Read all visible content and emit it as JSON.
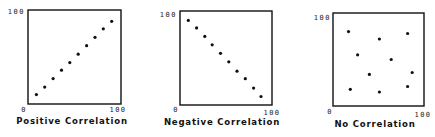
{
  "chart_data": [
    {
      "type": "scatter",
      "title": "Positive Correlation",
      "xlabel": "",
      "ylabel": "",
      "xlim": [
        0,
        100
      ],
      "ylim": [
        0,
        100
      ],
      "grid": false,
      "x_tick_labels": [
        "0",
        "100"
      ],
      "y_tick_labels": [
        "100"
      ],
      "points": [
        {
          "x": 9,
          "y": 10
        },
        {
          "x": 18,
          "y": 18
        },
        {
          "x": 27,
          "y": 27
        },
        {
          "x": 36,
          "y": 36
        },
        {
          "x": 45,
          "y": 44
        },
        {
          "x": 54,
          "y": 53
        },
        {
          "x": 63,
          "y": 62
        },
        {
          "x": 72,
          "y": 71
        },
        {
          "x": 81,
          "y": 80
        },
        {
          "x": 90,
          "y": 88
        }
      ]
    },
    {
      "type": "scatter",
      "title": "Negative Correlation",
      "xlabel": "",
      "ylabel": "",
      "xlim": [
        0,
        100
      ],
      "ylim": [
        0,
        100
      ],
      "grid": false,
      "x_tick_labels": [
        "0",
        "100"
      ],
      "y_tick_labels": [
        "100"
      ],
      "points": [
        {
          "x": 9,
          "y": 90
        },
        {
          "x": 18,
          "y": 82
        },
        {
          "x": 27,
          "y": 73
        },
        {
          "x": 35,
          "y": 64
        },
        {
          "x": 44,
          "y": 55
        },
        {
          "x": 53,
          "y": 46
        },
        {
          "x": 62,
          "y": 36
        },
        {
          "x": 71,
          "y": 28
        },
        {
          "x": 80,
          "y": 18
        },
        {
          "x": 88,
          "y": 9
        }
      ]
    },
    {
      "type": "scatter",
      "title": "No Correlation",
      "xlabel": "",
      "ylabel": "",
      "xlim": [
        0,
        100
      ],
      "ylim": [
        0,
        100
      ],
      "grid": false,
      "x_tick_labels": [
        "0",
        "100"
      ],
      "y_tick_labels": [
        "100"
      ],
      "points": [
        {
          "x": 17,
          "y": 80
        },
        {
          "x": 51,
          "y": 72
        },
        {
          "x": 82,
          "y": 78
        },
        {
          "x": 27,
          "y": 55
        },
        {
          "x": 64,
          "y": 50
        },
        {
          "x": 40,
          "y": 34
        },
        {
          "x": 87,
          "y": 36
        },
        {
          "x": 19,
          "y": 18
        },
        {
          "x": 51,
          "y": 15
        },
        {
          "x": 82,
          "y": 21
        }
      ]
    }
  ]
}
